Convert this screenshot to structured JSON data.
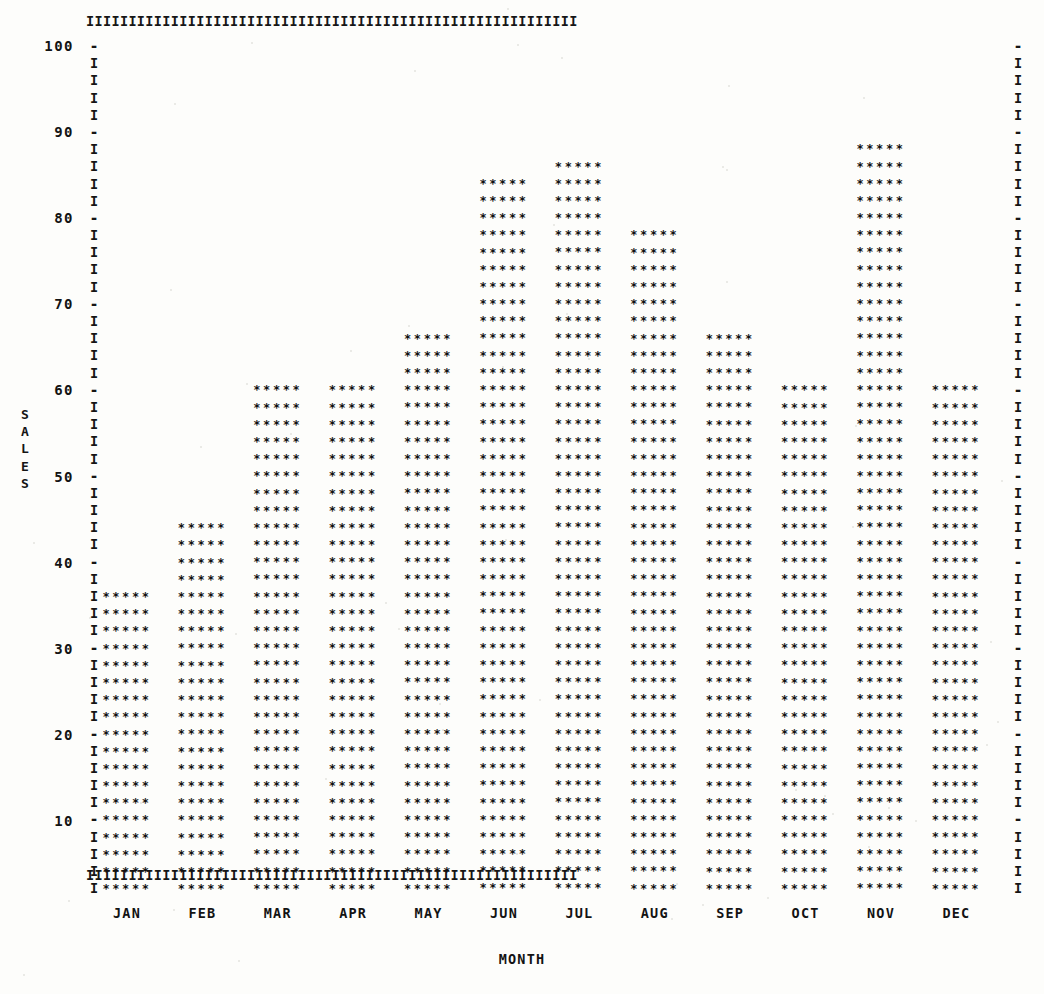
{
  "chart_data": {
    "type": "bar",
    "title": "",
    "subtitle": "",
    "xlabel": "MONTH",
    "ylabel": "SALES",
    "categories": [
      "JAN",
      "FEB",
      "MAR",
      "APR",
      "MAY",
      "JUN",
      "JUL",
      "AUG",
      "SEP",
      "OCT",
      "NOV",
      "DEC"
    ],
    "values": [
      36,
      44,
      60,
      60,
      66,
      84,
      86,
      78,
      66,
      60,
      88,
      60
    ],
    "ylim": [
      0,
      100
    ],
    "ytick_labels": [
      "100",
      "90",
      "80",
      "70",
      "60",
      "50",
      "40",
      "30",
      "20",
      "10"
    ],
    "ytick_values": [
      100,
      90,
      80,
      70,
      60,
      50,
      40,
      30,
      20,
      10
    ],
    "ytick_step": 10,
    "row_value_step": 2,
    "grid": false,
    "legend": "none",
    "render_style": "ascii-line-printer",
    "bar_glyph": "*",
    "bar_glyph_count_per_row": 5,
    "axis_glyph": "I",
    "tick_glyph": "-"
  },
  "axes": {
    "y_caption_letters": [
      "S",
      "A",
      "L",
      "E",
      "S"
    ],
    "x_caption": "MONTH"
  },
  "frame": {
    "top_rail_glyph": "I",
    "bottom_rail_glyph": "I",
    "left_rail_glyph": "I",
    "right_rail_glyph": "I",
    "rail_char_count": 58
  }
}
